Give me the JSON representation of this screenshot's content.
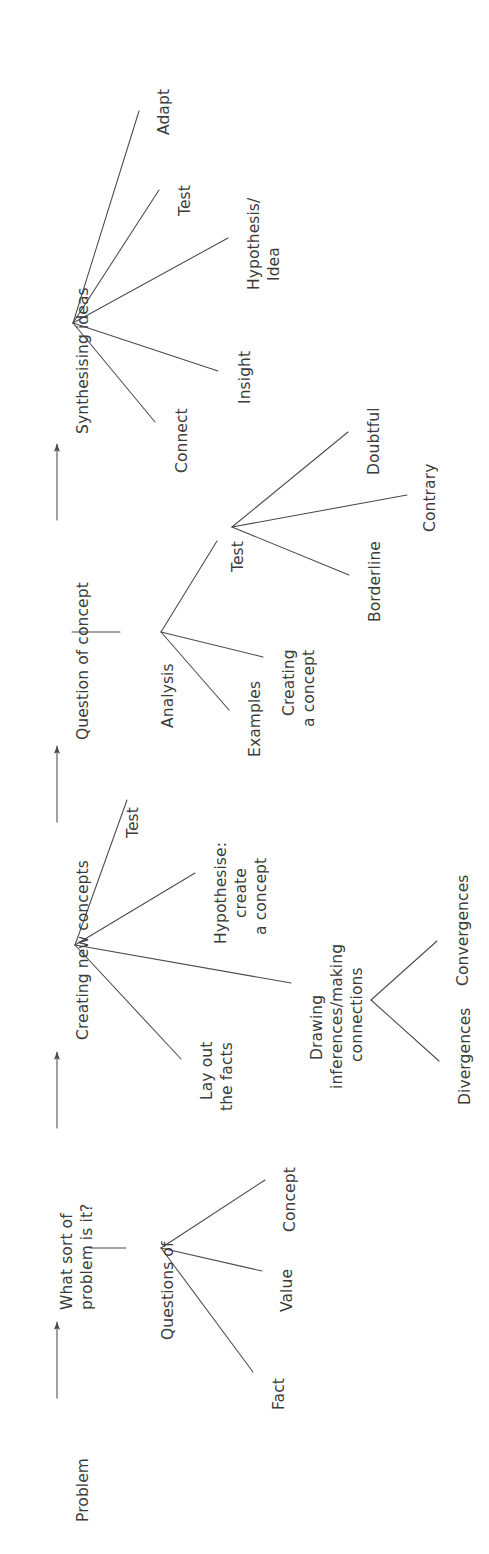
{
  "diagram": {
    "orientation": "text rotated 90 degrees counter-clockwise (reads bottom-to-top)",
    "ink_color": "#3b3b3b",
    "line_color": "#4a4a4a",
    "background": "#ffffff",
    "spine": {
      "nodes": [
        {
          "id": "problem",
          "label": "Problem"
        },
        {
          "id": "whatsort",
          "label": "What sort of\nproblem is it?"
        },
        {
          "id": "creating",
          "label": "Creating new concepts"
        },
        {
          "id": "question",
          "label": "Question of concept"
        },
        {
          "id": "synth",
          "label": "Synthesising ideas"
        }
      ],
      "connector": "arrow",
      "arrow_count": 4
    },
    "clusters": [
      {
        "id": "questions-of",
        "parent": "whatsort",
        "hub_label": "Questions of",
        "children": [
          {
            "id": "fact",
            "label": "Fact"
          },
          {
            "id": "value",
            "label": "Value"
          },
          {
            "id": "concept",
            "label": "Concept"
          }
        ]
      },
      {
        "id": "creating-new-concepts",
        "parent": "creating",
        "hub_label": "",
        "children": [
          {
            "id": "layout",
            "label": "Lay out\nthe facts"
          },
          {
            "id": "drawing",
            "label": "Drawing\ninferences/making\nconnections"
          },
          {
            "id": "hypothesise",
            "label": "Hypothesise:\ncreate\na concept"
          },
          {
            "id": "test1",
            "label": "Test"
          }
        ]
      },
      {
        "id": "drawing-inferences",
        "parent": "drawing",
        "hub_label": "",
        "children": [
          {
            "id": "divergences",
            "label": "Divergences"
          },
          {
            "id": "convergences",
            "label": "Convergences"
          }
        ]
      },
      {
        "id": "analysis",
        "parent": "question",
        "hub_label": "Analysis",
        "children": [
          {
            "id": "examples",
            "label": "Examples"
          },
          {
            "id": "creating-a-concept",
            "label": "Creating\na concept"
          },
          {
            "id": "test2",
            "label": "Test"
          }
        ]
      },
      {
        "id": "test-of-concept",
        "parent": "test2",
        "hub_label": "",
        "children": [
          {
            "id": "borderline",
            "label": "Borderline"
          },
          {
            "id": "contrary",
            "label": "Contrary"
          },
          {
            "id": "doubtful",
            "label": "Doubtful"
          }
        ]
      },
      {
        "id": "synthesising",
        "parent": "synth",
        "hub_label": "",
        "children": [
          {
            "id": "connect",
            "label": "Connect"
          },
          {
            "id": "insight",
            "label": "Insight"
          },
          {
            "id": "hypothesis",
            "label": "Hypothesis/\nIdea"
          },
          {
            "id": "test3",
            "label": "Test"
          },
          {
            "id": "adapt",
            "label": "Adapt"
          }
        ]
      }
    ],
    "labels": {
      "problem": "Problem",
      "what_sort_l1": "What sort of",
      "what_sort_l2": "problem is it?",
      "creating_new_concepts": "Creating new concepts",
      "question_of_concept": "Question of concept",
      "synthesising_ideas": "Synthesising ideas",
      "questions_of": "Questions of",
      "fact": "Fact",
      "value": "Value",
      "concept": "Concept",
      "lay_out_l1": "Lay out",
      "lay_out_l2": "the facts",
      "drawing_l1": "Drawing",
      "drawing_l2": "inferences/making",
      "drawing_l3": "connections",
      "divergences": "Divergences",
      "convergences": "Convergences",
      "hypothesise_l1": "Hypothesise:",
      "hypothesise_l2": "create",
      "hypothesise_l3": "a concept",
      "test1": "Test",
      "analysis": "Analysis",
      "examples": "Examples",
      "creating_concept_l1": "Creating",
      "creating_concept_l2": "a concept",
      "test2": "Test",
      "borderline": "Borderline",
      "contrary": "Contrary",
      "doubtful": "Doubtful",
      "connect": "Connect",
      "insight": "Insight",
      "hypothesis_l1": "Hypothesis/",
      "hypothesis_l2": "Idea",
      "test3": "Test",
      "adapt": "Adapt"
    }
  }
}
